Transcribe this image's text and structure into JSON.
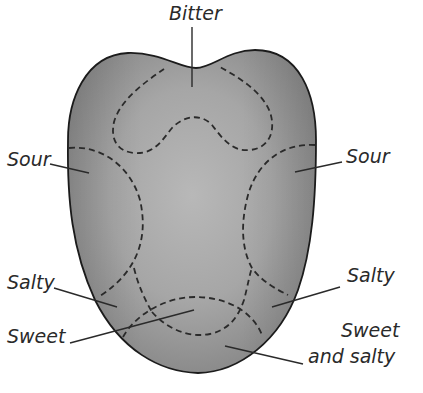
{
  "diagram": {
    "colors": {
      "background": "#ffffff",
      "tongue_fill_center": "#b4b4b4",
      "tongue_fill_edge": "#8a8a8a",
      "outline": "#1c1c1c",
      "dashed_zone": "#2a2a2a",
      "leader_line": "#2a2a2a",
      "text": "#2a2a2a"
    },
    "labels": {
      "bitter": "Bitter",
      "sour_left": "Sour",
      "sour_right": "Sour",
      "salty_left": "Salty",
      "salty_right": "Salty",
      "sweet": "Sweet",
      "sweet_and_salty_line1": "Sweet",
      "sweet_and_salty_line2": "and salty"
    },
    "zones": [
      {
        "name": "Bitter",
        "position": "back of tongue (top)"
      },
      {
        "name": "Sour",
        "position": "left side"
      },
      {
        "name": "Sour",
        "position": "right side"
      },
      {
        "name": "Salty",
        "position": "left front side"
      },
      {
        "name": "Salty",
        "position": "right front side"
      },
      {
        "name": "Sweet",
        "position": "tip"
      },
      {
        "name": "Sweet and salty",
        "position": "tip overlap"
      }
    ]
  }
}
